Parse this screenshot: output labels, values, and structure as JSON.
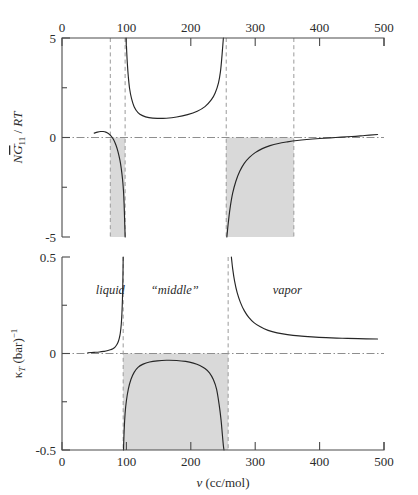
{
  "figure": {
    "panels": [
      {
        "id": "top",
        "ylabel_parts": {
          "N": "N",
          "Gbar": "G",
          "sub": "11",
          "slash": " / ",
          "RT": "RT"
        },
        "ylabel_plain": "N Ḡ11 / RT",
        "y_ticks": [
          5,
          2.5,
          0,
          -2.5,
          -5
        ],
        "y_tick_labels": [
          "5",
          "",
          "0",
          "",
          "-5"
        ],
        "ylim": [
          -5,
          5
        ],
        "x_ticks": [
          0,
          100,
          200,
          300,
          400,
          500
        ],
        "x_tick_labels": [
          "0",
          "100",
          "200",
          "300",
          "400",
          "500"
        ],
        "xlim": [
          0,
          500
        ],
        "axis_position": "top"
      },
      {
        "id": "bottom",
        "ylabel_plain": "κT (bar)⁻¹",
        "ylabel_parts": {
          "kappa": "κ",
          "sub": "T",
          "unit": " (bar)",
          "sup": "−1"
        },
        "y_ticks": [
          0.5,
          0.25,
          0,
          -0.25,
          -0.5
        ],
        "y_tick_labels": [
          "0.5",
          "",
          "0",
          "",
          "-0.5"
        ],
        "ylim": [
          -0.5,
          0.5
        ],
        "x_ticks": [
          0,
          100,
          200,
          300,
          400,
          500
        ],
        "x_tick_labels": [
          "0",
          "100",
          "200",
          "300",
          "400",
          "500"
        ],
        "xlim": [
          0,
          500
        ],
        "axis_position": "bottom",
        "xlabel_parts": {
          "v": "v",
          "unit": " (cc/mol)"
        },
        "xlabel_plain": "v (cc/mol)"
      }
    ],
    "region_labels": [
      {
        "name": "liquid",
        "text": "liquid",
        "x": 75
      },
      {
        "name": "middle",
        "text": "“middle”",
        "x": 175
      },
      {
        "name": "vapor",
        "text": "vapor",
        "x": 350
      }
    ],
    "colors": {
      "shade": "#d9d9d9",
      "curve": "#262626",
      "axis": "#4a4a4a",
      "dashed_guide": "#9a9a9a",
      "zero_line": "#8e8e8e",
      "background": "#ffffff"
    }
  },
  "chart_data": [
    {
      "type": "line",
      "panel": "top",
      "title": "",
      "xlabel": "",
      "ylabel": "N Ḡ11 / RT",
      "xlim": [
        0,
        500
      ],
      "ylim": [
        -5,
        5
      ],
      "xticks": [
        0,
        100,
        200,
        300,
        400,
        500
      ],
      "yticks": [
        -5,
        -2.5,
        0,
        2.5,
        5
      ],
      "grid": false,
      "legend": "none",
      "zero_reference_line": 0,
      "shaded_spans": [
        [
          75,
          98
        ],
        [
          255,
          360
        ]
      ],
      "dashed_verticals": [
        75,
        98,
        255,
        360
      ],
      "series": [
        {
          "name": "liquid-branch",
          "x": [
            50,
            55,
            60,
            64,
            68,
            72,
            76,
            80,
            84,
            87,
            90,
            92,
            94,
            95.5,
            96.5,
            97.3,
            97.8,
            98.1
          ],
          "y": [
            0.22,
            0.27,
            0.3,
            0.3,
            0.27,
            0.2,
            0.08,
            -0.1,
            -0.4,
            -0.72,
            -1.15,
            -1.55,
            -2.1,
            -2.7,
            -3.4,
            -4.2,
            -4.7,
            -5.0
          ]
        },
        {
          "name": "middle-branch-unstable",
          "x": [
            99.5,
            100.5,
            101.5,
            103,
            105,
            108,
            112,
            118,
            125,
            135,
            148,
            162,
            178,
            195,
            210,
            222,
            232,
            238,
            243,
            246,
            248,
            249.5,
            250.6
          ],
          "y": [
            5.0,
            4.3,
            3.7,
            3.05,
            2.45,
            1.95,
            1.55,
            1.25,
            1.1,
            1.0,
            0.96,
            0.97,
            1.03,
            1.15,
            1.32,
            1.55,
            1.9,
            2.25,
            2.75,
            3.3,
            3.95,
            4.55,
            5.0
          ]
        },
        {
          "name": "vapor-branch",
          "x": [
            256,
            258,
            261,
            265,
            270,
            276,
            283,
            291,
            300,
            311,
            323,
            336,
            350,
            365,
            380,
            400,
            425,
            450,
            470,
            490
          ],
          "y": [
            -5.0,
            -4.35,
            -3.55,
            -2.8,
            -2.2,
            -1.7,
            -1.3,
            -1.0,
            -0.76,
            -0.56,
            -0.41,
            -0.3,
            -0.22,
            -0.15,
            -0.1,
            -0.05,
            0.0,
            0.05,
            0.1,
            0.15
          ]
        }
      ]
    },
    {
      "type": "line",
      "panel": "bottom",
      "title": "",
      "xlabel": "v (cc/mol)",
      "ylabel": "κT (bar)⁻¹",
      "xlim": [
        0,
        500
      ],
      "ylim": [
        -0.5,
        0.5
      ],
      "xticks": [
        0,
        100,
        200,
        300,
        400,
        500
      ],
      "yticks": [
        -0.5,
        -0.25,
        0,
        0.25,
        0.5
      ],
      "grid": false,
      "legend": "none",
      "zero_reference_line": 0,
      "shaded_spans": [
        [
          95,
          258
        ]
      ],
      "dashed_verticals": [
        95,
        258
      ],
      "annotations": [
        "liquid",
        "“middle”",
        "vapor"
      ],
      "series": [
        {
          "name": "liquid-branch",
          "x": [
            40,
            50,
            58,
            65,
            70,
            75,
            79,
            82,
            85,
            87,
            89,
            90.5,
            92,
            93,
            93.8,
            94.4,
            94.8,
            95.0
          ],
          "y": [
            0.004,
            0.006,
            0.008,
            0.011,
            0.014,
            0.019,
            0.025,
            0.032,
            0.045,
            0.058,
            0.08,
            0.105,
            0.15,
            0.205,
            0.275,
            0.355,
            0.44,
            0.5
          ]
        },
        {
          "name": "middle-branch-negative",
          "x": [
            95.5,
            96.5,
            98,
            100,
            103,
            107,
            112,
            118,
            126,
            136,
            148,
            162,
            178,
            192,
            204,
            214,
            222,
            229,
            235,
            240,
            244,
            247,
            249,
            250.5,
            251.5
          ],
          "y": [
            -0.5,
            -0.4,
            -0.31,
            -0.245,
            -0.185,
            -0.135,
            -0.098,
            -0.072,
            -0.055,
            -0.044,
            -0.038,
            -0.035,
            -0.036,
            -0.041,
            -0.05,
            -0.062,
            -0.078,
            -0.1,
            -0.135,
            -0.185,
            -0.265,
            -0.345,
            -0.42,
            -0.475,
            -0.5
          ]
        },
        {
          "name": "vapor-branch",
          "x": [
            263,
            265,
            268,
            272,
            277,
            283,
            290,
            298,
            308,
            320,
            334,
            350,
            368,
            388,
            410,
            435,
            460,
            490
          ],
          "y": [
            0.5,
            0.44,
            0.375,
            0.315,
            0.265,
            0.222,
            0.187,
            0.16,
            0.138,
            0.12,
            0.107,
            0.098,
            0.091,
            0.086,
            0.082,
            0.079,
            0.077,
            0.075
          ]
        }
      ]
    }
  ]
}
